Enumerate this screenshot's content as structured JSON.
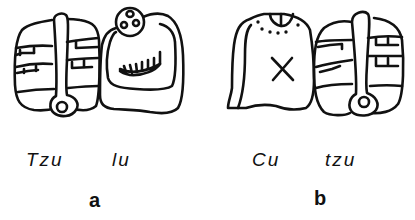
{
  "figure": {
    "panels": [
      {
        "id": "a",
        "letter": "a",
        "glyphs": [
          {
            "syllable": "Tzu",
            "icon": "tzu-glyph-icon"
          },
          {
            "syllable": "lu",
            "icon": "lu-glyph-icon"
          }
        ]
      },
      {
        "id": "b",
        "letter": "b",
        "glyphs": [
          {
            "syllable": "Cu",
            "icon": "cu-glyph-icon"
          },
          {
            "syllable": "tzu",
            "icon": "tzu-glyph-icon"
          }
        ]
      }
    ]
  },
  "colors": {
    "ink": "#111111",
    "background": "#ffffff"
  }
}
